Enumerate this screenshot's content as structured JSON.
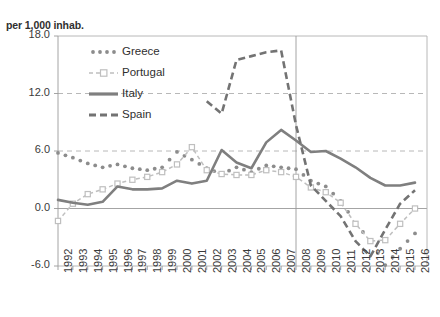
{
  "chart_data": {
    "type": "line",
    "title": "",
    "ylabel": "per 1,000 inhab.",
    "xlabel": "",
    "ylim": [
      -6.0,
      18.0
    ],
    "yticks": [
      "-6.0",
      "0.0",
      "6.0",
      "12.0",
      "18.0"
    ],
    "ytick_values": [
      -6.0,
      0.0,
      6.0,
      12.0,
      18.0
    ],
    "grid": "horizontal-dashed",
    "legend_position": "top-left-inside",
    "annotations": [
      {
        "name": "vertical-reference-line",
        "x": "2008"
      }
    ],
    "categories": [
      "1992",
      "1993",
      "1994",
      "1995",
      "1996",
      "1997",
      "1998",
      "1999",
      "2000",
      "2001",
      "2002",
      "2003",
      "2004",
      "2005",
      "2006",
      "2007",
      "2008",
      "2009",
      "2010",
      "2011",
      "2012",
      "2013",
      "2014",
      "2015",
      "2016"
    ],
    "series": [
      {
        "name": "Greece",
        "style": "dotted",
        "color": "#8c8c8c",
        "values": [
          5.8,
          5.3,
          4.7,
          4.3,
          4.6,
          4.2,
          4.0,
          4.3,
          5.9,
          5.1,
          4.2,
          3.6,
          4.3,
          3.8,
          4.5,
          4.3,
          4.1,
          2.9,
          2.3,
          0.8,
          -1.5,
          -3.4,
          -5.9,
          -4.2,
          -2.6
        ]
      },
      {
        "name": "Portugal",
        "style": "dashed-marker",
        "color": "#bfbfbf",
        "values": [
          -1.3,
          0.5,
          1.5,
          2.0,
          2.6,
          3.0,
          3.3,
          3.8,
          4.6,
          6.4,
          4.0,
          3.6,
          3.5,
          3.5,
          4.0,
          3.8,
          3.3,
          2.2,
          1.7,
          0.6,
          -1.6,
          -3.4,
          -3.3,
          -1.6,
          0.0
        ]
      },
      {
        "name": "Italy",
        "style": "solid",
        "color": "#7f7f7f",
        "values": [
          0.9,
          0.6,
          0.4,
          0.7,
          2.3,
          2.0,
          2.0,
          2.1,
          2.9,
          2.6,
          2.9,
          6.1,
          4.8,
          4.2,
          6.9,
          8.2,
          7.1,
          5.9,
          6.0,
          5.2,
          4.3,
          3.2,
          2.4,
          2.4,
          2.7
        ]
      },
      {
        "name": "Spain",
        "style": "dashed",
        "color": "#737373",
        "values": [
          null,
          null,
          null,
          null,
          null,
          null,
          null,
          null,
          null,
          null,
          11.2,
          9.9,
          15.5,
          15.9,
          16.3,
          16.5,
          8.7,
          2.4,
          0.8,
          -0.8,
          -3.4,
          -5.0,
          -2.2,
          0.5,
          1.9
        ]
      }
    ],
    "legend": [
      {
        "label": "Greece",
        "marker": "dotted"
      },
      {
        "label": "Portugal",
        "marker": "dashed-square"
      },
      {
        "label": "Italy",
        "marker": "solid"
      },
      {
        "label": "Spain",
        "marker": "dashed-bold"
      }
    ],
    "colors": {
      "greece": "#8c8c8c",
      "portugal": "#bfbfbf",
      "italy": "#7f7f7f",
      "spain": "#737373",
      "grid": "#b0b0b0",
      "axis": "#9a9a9a",
      "text": "#3a3a3a"
    }
  }
}
